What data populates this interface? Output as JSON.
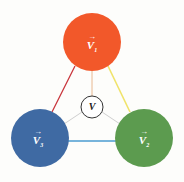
{
  "diagram": {
    "nodes": [
      {
        "id": "top",
        "label": "V",
        "subscript": "1",
        "arrow": "→",
        "color": "#f2582a",
        "cx": 92,
        "cy": 42,
        "r": 29
      },
      {
        "id": "left",
        "label": "V",
        "subscript": "3",
        "arrow": "→",
        "color": "#3f6aa3",
        "cx": 40,
        "cy": 138,
        "r": 29
      },
      {
        "id": "right",
        "label": "V",
        "subscript": "2",
        "arrow": "→",
        "color": "#5c9b4f",
        "cx": 144,
        "cy": 138,
        "r": 29
      }
    ],
    "center": {
      "label": "V",
      "cx": 92,
      "cy": 107,
      "r": 11
    },
    "edges": [
      {
        "from": "top",
        "to": "left",
        "color": "#c8333a"
      },
      {
        "from": "top",
        "to": "right",
        "color": "#f0e36a"
      },
      {
        "from": "left",
        "to": "right",
        "color": "#4a9bd0"
      }
    ],
    "spokes_color": "#cfcfcf",
    "top_spoke_color": "#e8b890"
  }
}
